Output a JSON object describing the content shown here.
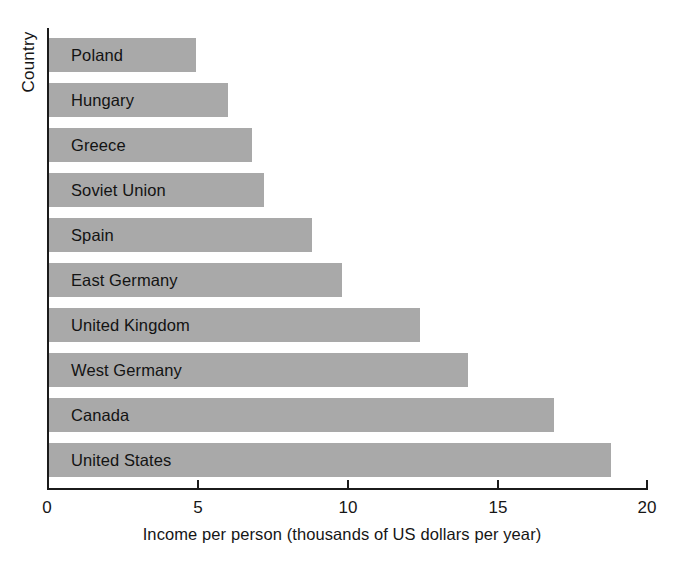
{
  "chart_data": {
    "type": "bar",
    "orientation": "horizontal",
    "title": "",
    "xlabel": "Income per person (thousands of US dollars per year)",
    "ylabel": "Country",
    "categories": [
      "Poland",
      "Hungary",
      "Greece",
      "Soviet Union",
      "Spain",
      "East Germany",
      "United Kingdom",
      "West Germany",
      "Canada",
      "United States"
    ],
    "values": [
      4.9,
      6.0,
      6.8,
      7.2,
      8.8,
      9.8,
      12.4,
      14.0,
      16.9,
      18.8
    ],
    "xlim": [
      0,
      20
    ],
    "xticks": [
      0,
      5,
      10,
      15,
      20
    ],
    "xtick_labels": [
      "0",
      "5",
      "10",
      "15",
      "20"
    ],
    "grid": false,
    "legend": false,
    "bar_color": "#a9a9a9",
    "axis_color": "#1b1b1b",
    "text_color": "#161616",
    "label_placement": "inside-bar-left"
  }
}
